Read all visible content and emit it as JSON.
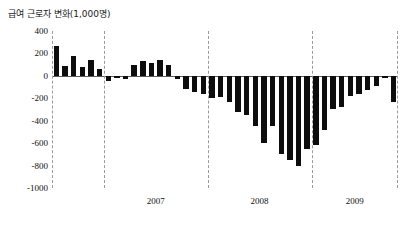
{
  "chart_data": {
    "type": "bar",
    "title": "급여 근로자 변화(1,000명)",
    "xlabel": "",
    "ylabel": "",
    "ylim": [
      -1000,
      400
    ],
    "yticks": [
      400,
      200,
      0,
      -200,
      -400,
      -600,
      -800,
      -1000
    ],
    "ytick_labels": [
      "400",
      "200",
      "0",
      "-200",
      "-400",
      "-600",
      "-800",
      "-1000"
    ],
    "grid": false,
    "legend": null,
    "zero_line": true,
    "year_separators": [
      "2007",
      "2008",
      "2009"
    ],
    "x_tick_labels": [
      "2007",
      "2008",
      "2009"
    ],
    "bar_color": "#0d0d0d",
    "categories": [
      "2006-07",
      "2006-08",
      "2006-09",
      "2006-10",
      "2006-11",
      "2006-12",
      "2007-01",
      "2007-02",
      "2007-03",
      "2007-04",
      "2007-05",
      "2007-06",
      "2007-07",
      "2007-08",
      "2007-09",
      "2007-10",
      "2007-11",
      "2007-12",
      "2008-01",
      "2008-02",
      "2008-03",
      "2008-04",
      "2008-05",
      "2008-06",
      "2008-07",
      "2008-08",
      "2008-09",
      "2008-10",
      "2008-11",
      "2008-12",
      "2009-01",
      "2009-02",
      "2009-03",
      "2009-04",
      "2009-05",
      "2009-06",
      "2009-07",
      "2009-08",
      "2009-09",
      "2009-10"
    ],
    "values": [
      270,
      90,
      180,
      75,
      140,
      60,
      -45,
      -20,
      -25,
      95,
      130,
      115,
      140,
      100,
      -30,
      -120,
      -145,
      -165,
      -200,
      -185,
      -230,
      -320,
      -350,
      -450,
      -600,
      -450,
      -700,
      -750,
      -800,
      -650,
      -620,
      -480,
      -300,
      -280,
      -180,
      -160,
      -130,
      -90,
      -20,
      -230
    ]
  }
}
